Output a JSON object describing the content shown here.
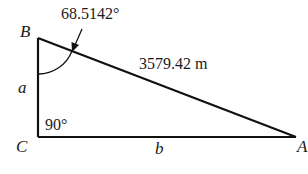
{
  "diagram": {
    "type": "right-triangle",
    "vertices": {
      "A": {
        "label": "A"
      },
      "B": {
        "label": "B"
      },
      "C": {
        "label": "C"
      }
    },
    "sides": {
      "a": {
        "label": "a",
        "between": "B-C"
      },
      "b": {
        "label": "b",
        "between": "C-A"
      },
      "hypotenuse": {
        "label": "3579.42 m",
        "between": "B-A"
      }
    },
    "angles": {
      "B": {
        "label": "68.5142°"
      },
      "C": {
        "label": "90°"
      }
    },
    "colors": {
      "stroke": "#111111",
      "text": "#1a1a1a",
      "background": "#ffffff"
    }
  }
}
